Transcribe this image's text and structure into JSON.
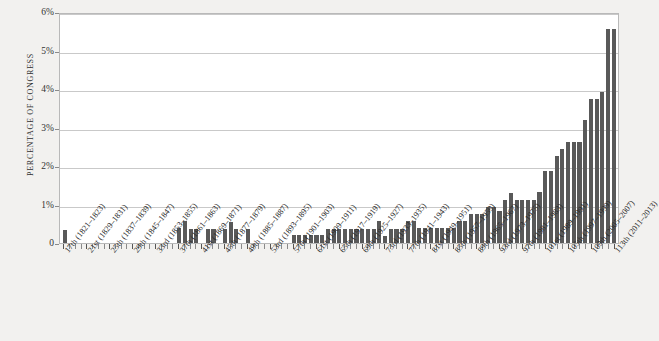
{
  "chart_data": {
    "type": "bar",
    "title": "",
    "xlabel": "",
    "ylabel": "PERCENTAGE OF CONGRESS",
    "ylim": [
      0,
      6
    ],
    "ytick_labels": [
      "6%",
      "5%",
      "4%",
      "3%",
      "2%",
      "1%",
      "0"
    ],
    "ytick_values": [
      6,
      5,
      4,
      3,
      2,
      1,
      0
    ],
    "grid": true,
    "legend": false,
    "bar_color": "#595959",
    "plot_background": "#ffffff",
    "page_background": "#f2f1ef",
    "categories": [
      "17th (1821-1823)",
      "18th (1823-1825)",
      "19th (1825-1827)",
      "20th (1827-1829)",
      "21st (1829-1831)",
      "22nd (1831-1833)",
      "23rd (1833-1835)",
      "24th (1835-1837)",
      "25th (1837-1839)",
      "26th (1839-1841)",
      "27th (1841-1843)",
      "28th (1843-1845)",
      "29th (1845-1847)",
      "30th (1847-1849)",
      "31st (1849-1851)",
      "32nd (1851-1853)",
      "33rd (1853-1855)",
      "34th (1855-1857)",
      "35th (1857-1859)",
      "36th (1859-1861)",
      "37th (1861-1863)",
      "38th (1863-1865)",
      "39th (1865-1867)",
      "40th (1867-1869)",
      "41st (1869-1871)",
      "42nd (1871-1873)",
      "43rd (1873-1875)",
      "44th (1875-1877)",
      "45th (1877-1879)",
      "46th (1879-1881)",
      "47th (1881-1883)",
      "48th (1883-1885)",
      "49th (1885-1887)",
      "50th (1887-1889)",
      "51st (1889-1891)",
      "52nd (1891-1893)",
      "53rd (1893-1895)",
      "54th (1895-1897)",
      "55th (1897-1899)",
      "56th (1899-1901)",
      "57th (1901-1903)",
      "58th (1903-1905)",
      "59th (1905-1907)",
      "60th (1907-1909)",
      "61st (1909-1911)",
      "62nd (1911-1913)",
      "63rd (1913-1915)",
      "64th (1915-1917)",
      "65th (1917-1919)",
      "66th (1919-1921)",
      "67th (1921-1923)",
      "68th (1923-1925)",
      "69th (1925-1927)",
      "70th (1927-1929)",
      "71st (1929-1931)",
      "72nd (1931-1933)",
      "73rd (1933-1935)",
      "74th (1935-1937)",
      "75th (1937-1939)",
      "76th (1939-1941)",
      "77th (1941-1943)",
      "78th (1943-1945)",
      "79th (1945-1947)",
      "80th (1947-1949)",
      "81st (1949-1951)",
      "82nd (1951-1953)",
      "83rd (1953-1955)",
      "84th (1955-1957)",
      "85th (1957-1959)",
      "86th (1959-1961)",
      "87th (1961-1963)",
      "88th (1963-1965)",
      "89th (1965-1967)",
      "90th (1967-1969)",
      "91st (1969-1971)",
      "92nd (1971-1973)",
      "93rd (1973-1975)",
      "94th (1975-1977)",
      "95th (1977-1979)",
      "96th (1979-1981)",
      "97th (1981-1983)",
      "98th (1983-1985)",
      "99th (1985-1987)",
      "100th (1987-1989)",
      "101st (1989-1991)",
      "102nd (1991-1993)",
      "103rd (1993-1995)",
      "104th (1995-1997)",
      "105th (1997-1999)",
      "106th (1999-2001)",
      "107th (2001-2003)",
      "108th (2003-2005)",
      "109th (2005-2007)",
      "110th (2007-2009)",
      "111th (2009-2011)",
      "112th (2011-2013)",
      "113th (2013-2015)"
    ],
    "values": [
      0.33,
      0,
      0,
      0,
      0,
      0,
      0,
      0,
      0,
      0,
      0,
      0,
      0,
      0,
      0,
      0,
      0,
      0,
      0,
      0,
      0.38,
      0.56,
      0.37,
      0.37,
      0,
      0.37,
      0.36,
      0,
      0.36,
      0.54,
      0.36,
      0,
      0.36,
      0,
      0,
      0,
      0,
      0,
      0,
      0,
      0.22,
      0.22,
      0.22,
      0.22,
      0.22,
      0.22,
      0.37,
      0.37,
      0.37,
      0.37,
      0.37,
      0.37,
      0.37,
      0.37,
      0.37,
      0.56,
      0.19,
      0.37,
      0.37,
      0.37,
      0.56,
      0.56,
      0.38,
      0.38,
      0.38,
      0.38,
      0.38,
      0.38,
      0.38,
      0.56,
      0.56,
      0.75,
      0.75,
      0.75,
      0.94,
      0.94,
      0.82,
      1.13,
      1.3,
      1.13,
      1.13,
      1.13,
      1.13,
      1.32,
      1.88,
      1.88,
      2.25,
      2.43,
      2.62,
      2.62,
      2.62,
      3.2,
      3.75,
      3.74,
      3.93,
      5.57,
      5.57
    ],
    "tick_label_interval": 4,
    "tick_labels_shown": [
      "17th (1821–1823)",
      "21st (1829–1831)",
      "25th (1837–1839)",
      "29th (1845–1847)",
      "33rd (1853–1855)",
      "37th (1861–1863)",
      "41st (1869–1871)",
      "45th (1877–1879)",
      "49th (1885–1887)",
      "53rd (1893–1895)",
      "57th (1901–1903)",
      "61st (1909–1911)",
      "65th (1917–1919)",
      "69th (1925–1927)",
      "73rd (1933–1935)",
      "77th (1941–1943)",
      "81st (1949–1951)",
      "85th (1957–1959)",
      "89th (1965–1967)",
      "93rd (1973–1975)",
      "97th (1981–1983)",
      "101st (1989–1991)",
      "105th (1997–1999)",
      "109th (2005–2007)",
      "113th (2011–2013)"
    ]
  }
}
